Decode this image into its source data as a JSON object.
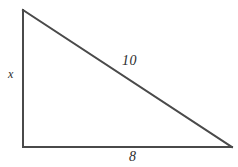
{
  "figure": {
    "kind": "right-triangle-diagram",
    "background_color": "#ffffff",
    "stroke_color": "#4a4a4a",
    "text_color": "#2b2b2b",
    "stroke_width": 2,
    "width": 238,
    "height": 167
  },
  "vertices": {
    "apex": {
      "x": 23,
      "y": 10
    },
    "right_angle": {
      "x": 23,
      "y": 147
    },
    "base_right": {
      "x": 232,
      "y": 147
    }
  },
  "labels": {
    "vertical_leg": "x",
    "hypotenuse": "10",
    "horizontal_leg": "8"
  },
  "chart_data": {
    "type": "diagram",
    "title": "",
    "shape": "right triangle",
    "sides": [
      {
        "name": "vertical leg",
        "label": "x",
        "known": false
      },
      {
        "name": "horizontal leg",
        "label": "8",
        "known": true,
        "value": 8
      },
      {
        "name": "hypotenuse",
        "label": "10",
        "known": true,
        "value": 10
      }
    ],
    "right_angle_at": "bottom-left vertex"
  }
}
